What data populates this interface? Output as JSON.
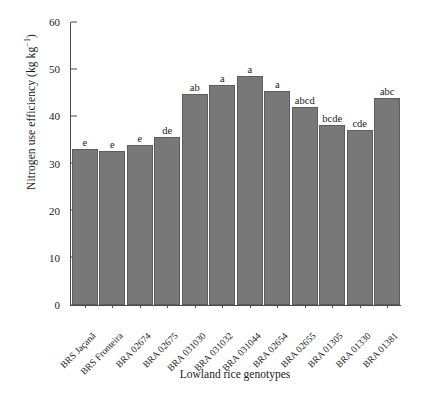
{
  "chart_data": {
    "type": "bar",
    "title": "",
    "subtitle": "",
    "xlabel": "Lowland rice genotypes",
    "ylabel": "Nitrogen use efficiency (kg kg⁻¹)",
    "ylabel_text": "Nitrogen use efficiency (kg kg",
    "ylabel_sup": "−1",
    "ylabel_tail": ")",
    "ylim": [
      0,
      60
    ],
    "ytick_labels": [
      "60",
      "50",
      "40",
      "30",
      "20",
      "10",
      "0"
    ],
    "ytick_values": [
      60,
      50,
      40,
      30,
      20,
      10,
      0
    ],
    "grid": false,
    "legend": "none",
    "bar_color": "#787878",
    "bar_edge_color": "#5d5d5d",
    "axis_color": "#4a4a4a",
    "categories": [
      "BRS Jaçanã",
      "BRS Fronteira",
      "BRA 02674",
      "BRA 02675",
      "BRA 031030",
      "BRA 031032",
      "BRA 031044",
      "BRA 02654",
      "BRA 02655",
      "BRA 01305",
      "BRA 01330",
      "BRA 01381"
    ],
    "values": [
      33.1,
      32.7,
      34.0,
      35.7,
      44.7,
      46.7,
      48.6,
      45.4,
      42.0,
      38.2,
      37.2,
      43.8
    ],
    "annotations": [
      "e",
      "e",
      "e",
      "de",
      "ab",
      "a",
      "a",
      "a",
      "abcd",
      "bcde",
      "cde",
      "abc"
    ],
    "bars": [
      {
        "category": "BRS Jaçanã",
        "value": 33.1,
        "annotation": "e"
      },
      {
        "category": "BRS Fronteira",
        "value": 32.7,
        "annotation": "e"
      },
      {
        "category": "BRA 02674",
        "value": 34.0,
        "annotation": "e"
      },
      {
        "category": "BRA 02675",
        "value": 35.7,
        "annotation": "de"
      },
      {
        "category": "BRA 031030",
        "value": 44.7,
        "annotation": "ab"
      },
      {
        "category": "BRA 031032",
        "value": 46.7,
        "annotation": "a"
      },
      {
        "category": "BRA 031044",
        "value": 48.6,
        "annotation": "a"
      },
      {
        "category": "BRA 02654",
        "value": 45.4,
        "annotation": "a"
      },
      {
        "category": "BRA 02655",
        "value": 42.0,
        "annotation": "abcd"
      },
      {
        "category": "BRA 01305",
        "value": 38.2,
        "annotation": "bcde"
      },
      {
        "category": "BRA 01330",
        "value": 37.2,
        "annotation": "cde"
      },
      {
        "category": "BRA 01381",
        "value": 43.8,
        "annotation": "abc"
      }
    ]
  }
}
